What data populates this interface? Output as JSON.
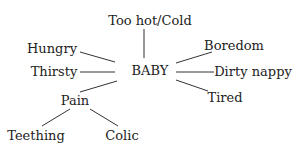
{
  "diagram": {
    "type": "mind-map",
    "center": {
      "id": "baby",
      "label": "BABY",
      "x": 150,
      "y": 70
    },
    "nodes": [
      {
        "id": "too-hot-cold",
        "label": "Too hot/Cold",
        "x": 150,
        "y": 20
      },
      {
        "id": "hungry",
        "label": "Hungry",
        "x": 52,
        "y": 48
      },
      {
        "id": "thirsty",
        "label": "Thirsty",
        "x": 54,
        "y": 71
      },
      {
        "id": "pain",
        "label": "Pain",
        "x": 75,
        "y": 100
      },
      {
        "id": "teething",
        "label": "Teething",
        "x": 36,
        "y": 135
      },
      {
        "id": "colic",
        "label": "Colic",
        "x": 122,
        "y": 135
      },
      {
        "id": "boredom",
        "label": "Boredom",
        "x": 234,
        "y": 45
      },
      {
        "id": "dirty-nappy",
        "label": "Dirty nappy",
        "x": 253,
        "y": 71
      },
      {
        "id": "tired",
        "label": "Tired",
        "x": 225,
        "y": 97
      }
    ],
    "edges": [
      {
        "from": "baby",
        "to": "too-hot-cold",
        "x1": 144,
        "y1": 29,
        "x2": 144,
        "y2": 58
      },
      {
        "from": "baby",
        "to": "hungry",
        "x1": 80,
        "y1": 52,
        "x2": 115,
        "y2": 62
      },
      {
        "from": "baby",
        "to": "thirsty",
        "x1": 80,
        "y1": 72,
        "x2": 115,
        "y2": 72
      },
      {
        "from": "baby",
        "to": "pain",
        "x1": 80,
        "y1": 92,
        "x2": 117,
        "y2": 81
      },
      {
        "from": "baby",
        "to": "boredom",
        "x1": 176,
        "y1": 63,
        "x2": 212,
        "y2": 52
      },
      {
        "from": "baby",
        "to": "dirty-nappy",
        "x1": 176,
        "y1": 72,
        "x2": 214,
        "y2": 72
      },
      {
        "from": "baby",
        "to": "tired",
        "x1": 176,
        "y1": 80,
        "x2": 208,
        "y2": 91
      },
      {
        "from": "pain",
        "to": "teething",
        "x1": 70,
        "y1": 109,
        "x2": 42,
        "y2": 126
      },
      {
        "from": "pain",
        "to": "colic",
        "x1": 90,
        "y1": 109,
        "x2": 118,
        "y2": 126
      }
    ],
    "line_color": "#333333",
    "text_color": "#222222"
  }
}
